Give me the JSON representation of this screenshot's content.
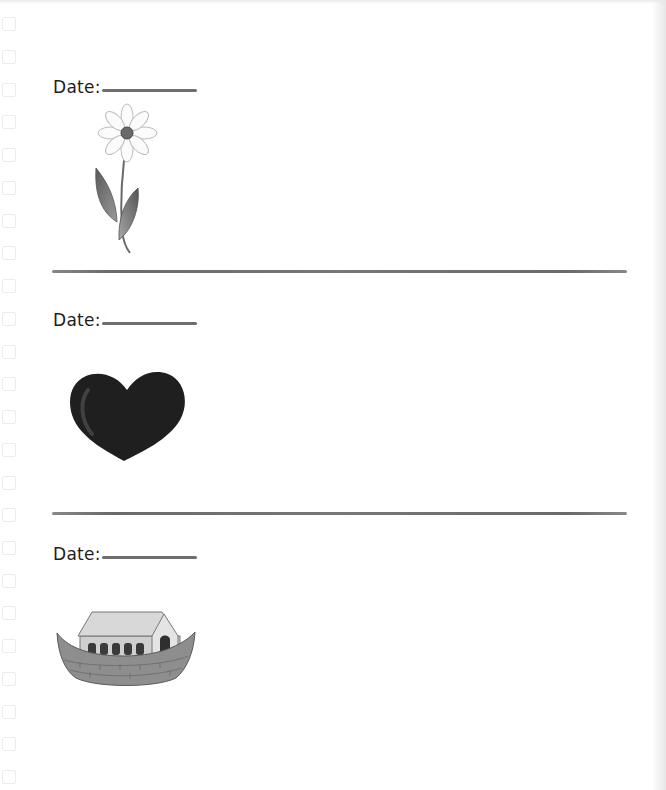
{
  "sections": [
    {
      "date_label": "Date:",
      "date_value": "",
      "illustration": "daisy-flower"
    },
    {
      "date_label": "Date:",
      "date_value": "",
      "illustration": "black-heart"
    },
    {
      "date_label": "Date:",
      "date_value": "",
      "illustration": "noahs-ark"
    }
  ],
  "colors": {
    "text": "#1e1e1e",
    "rule_line": "#6e6e6e",
    "heart": "#1f1f1f",
    "binding_box": "#ececec"
  }
}
